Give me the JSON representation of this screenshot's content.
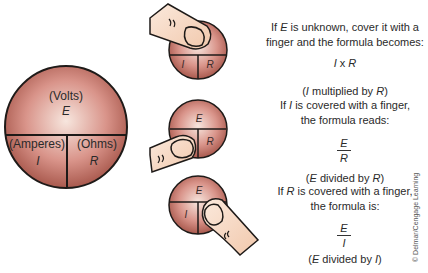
{
  "main_circle": {
    "top_unit": "(Volts)",
    "top_symbol": "E",
    "left_unit": "(Amperes)",
    "left_symbol": "I",
    "right_unit": "(Ohms)",
    "right_symbol": "R"
  },
  "small_circles": [
    {
      "covered": "E",
      "visible": [
        "I",
        "R"
      ]
    },
    {
      "covered": "I",
      "visible": [
        "E",
        "R"
      ]
    },
    {
      "covered": "R",
      "visible": [
        "E",
        "I"
      ]
    }
  ],
  "instructions": {
    "e_line1_a": "If ",
    "e_line1_sym": "E",
    "e_line1_b": " is unknown, cover it with a",
    "e_line2": "finger and the formula becomes:",
    "e_formula_a": "I",
    "e_formula_op": " x ",
    "e_formula_b": "R",
    "e_desc_open": "(",
    "e_desc_a": "I",
    "e_desc_mid": " multiplied by ",
    "e_desc_b": "R",
    "e_desc_close": ")",
    "i_line1_a": "If ",
    "i_line1_sym": "I",
    "i_line1_b": " is covered with a finger,",
    "i_line2": "the formula reads:",
    "i_num": "E",
    "i_den": "R",
    "i_desc_open": "(",
    "i_desc_a": "E",
    "i_desc_mid": " divided by ",
    "i_desc_b": "R",
    "i_desc_close": ")",
    "r_line1_a": "If ",
    "r_line1_sym": "R",
    "r_line1_b": " is covered with a finger,",
    "r_line2": "the formula is:",
    "r_num": "E",
    "r_den": "I",
    "r_desc_open": "(",
    "r_desc_a": "E",
    "r_desc_mid": " divided by ",
    "r_desc_b": "I",
    "r_desc_close": ")"
  },
  "credit": "© Delmar/Cengage Learning",
  "colors": {
    "circle_dark": "#a8584a",
    "circle_light": "#f6e4dc",
    "finger": "#f6d9c4",
    "outline": "#1e1a18"
  }
}
